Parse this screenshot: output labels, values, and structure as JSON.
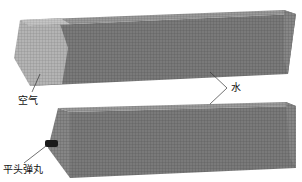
{
  "figure": {
    "labels": {
      "air": "空气",
      "water": "水",
      "projectile": "平头弹丸"
    },
    "colors": {
      "mesh_water": "#6e6e6e",
      "mesh_air": "#a9a9a9",
      "projectile": "#1a1a1a",
      "leader_line": "#333333"
    }
  }
}
